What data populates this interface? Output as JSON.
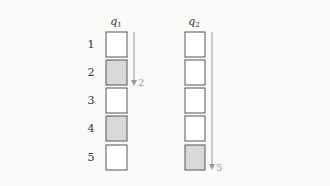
{
  "diagram": {
    "row_labels": [
      "1",
      "2",
      "3",
      "4",
      "5"
    ],
    "columns": [
      {
        "title": "q",
        "subscript": "1",
        "cells": [
          {
            "index": 1,
            "shaded": false
          },
          {
            "index": 2,
            "shaded": true
          },
          {
            "index": 3,
            "shaded": false
          },
          {
            "index": 4,
            "shaded": true
          },
          {
            "index": 5,
            "shaded": false
          }
        ],
        "arrow_label": "2"
      },
      {
        "title": "q",
        "subscript": "2",
        "cells": [
          {
            "index": 1,
            "shaded": false
          },
          {
            "index": 2,
            "shaded": false
          },
          {
            "index": 3,
            "shaded": false
          },
          {
            "index": 4,
            "shaded": false
          },
          {
            "index": 5,
            "shaded": true
          }
        ],
        "arrow_label": "5"
      }
    ],
    "colors": {
      "background": "#fafaf8",
      "box_stroke": "#555555",
      "box_fill": "#ffffff",
      "shaded_fill": "#d9d9d9",
      "arrow": "#9a9a9a",
      "text": "#333333"
    }
  }
}
